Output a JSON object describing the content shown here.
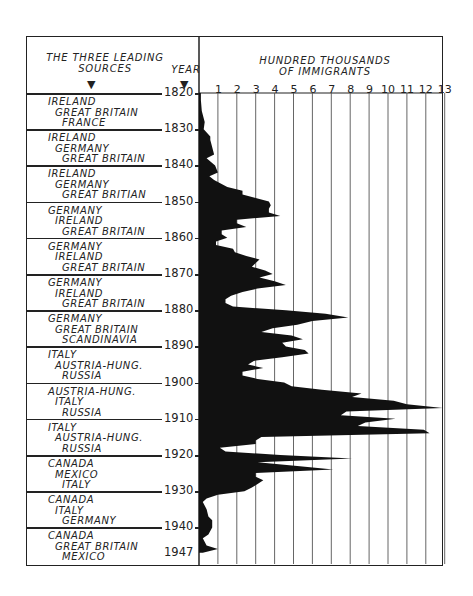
{
  "chart_data": {
    "type": "area",
    "title": "",
    "header_left": "THE THREE LEADING SOURCES",
    "header_year": "YEAR",
    "xlabel": "HUNDRED THOUSANDS OF IMMIGRANTS",
    "ylabel": "YEAR",
    "x_ticks": [
      "1",
      "2",
      "3",
      "4",
      "5",
      "6",
      "7",
      "8",
      "9",
      "10",
      "11",
      "12",
      "13"
    ],
    "xlim": [
      0,
      13
    ],
    "y_ticks": [
      "1820",
      "1830",
      "1840",
      "1850",
      "1860",
      "1870",
      "1880",
      "1890",
      "1900",
      "1910",
      "1920",
      "1930",
      "1940",
      "1947"
    ],
    "ylim": [
      1820,
      1947
    ],
    "grid": "vertical",
    "orientation": "horizontal (years run downward, values extend right)",
    "decades": [
      {
        "period": "1820",
        "sources": [
          "IRELAND",
          "GREAT BRITAIN",
          "FRANCE"
        ]
      },
      {
        "period": "1830",
        "sources": [
          "IRELAND",
          "GERMANY",
          "GREAT BRITAIN"
        ]
      },
      {
        "period": "1840",
        "sources": [
          "IRELAND",
          "GERMANY",
          "GREAT BRITIAN"
        ]
      },
      {
        "period": "1850",
        "sources": [
          "GERMANY",
          "IRELAND",
          "GREAT BRITAIN"
        ]
      },
      {
        "period": "1860",
        "sources": [
          "GERMANY",
          "IRELAND",
          "GREAT BRITAIN"
        ]
      },
      {
        "period": "1870",
        "sources": [
          "GERMANY",
          "IRELAND",
          "GREAT BRITAIN"
        ]
      },
      {
        "period": "1880",
        "sources": [
          "GERMANY",
          "GREAT BRITAIN",
          "SCANDINAVIA"
        ]
      },
      {
        "period": "1890",
        "sources": [
          "ITALY",
          "AUSTRIA-HUNG.",
          "RUSSIA"
        ]
      },
      {
        "period": "1900",
        "sources": [
          "AUSTRIA-HUNG.",
          "ITALY",
          "RUSSIA"
        ]
      },
      {
        "period": "1910",
        "sources": [
          "ITALY",
          "AUSTRIA-HUNG.",
          "RUSSIA"
        ]
      },
      {
        "period": "1920",
        "sources": [
          "CANADA",
          "MEXICO",
          "ITALY"
        ]
      },
      {
        "period": "1930",
        "sources": [
          "CANADA",
          "ITALY",
          "GERMANY"
        ]
      },
      {
        "period": "1940",
        "sources": [
          "CANADA",
          "GREAT BRITAIN",
          "MEXICO"
        ]
      }
    ],
    "series": [
      {
        "name": "Immigrants (hundred thousands)",
        "x": [
          1820,
          1822,
          1825,
          1828,
          1830,
          1832,
          1833,
          1834,
          1836,
          1837,
          1838,
          1840,
          1842,
          1843,
          1844,
          1846,
          1847,
          1848,
          1849,
          1850,
          1851,
          1852,
          1853,
          1854,
          1855,
          1856,
          1857,
          1858,
          1859,
          1860,
          1861,
          1862,
          1863,
          1864,
          1865,
          1866,
          1867,
          1868,
          1869,
          1870,
          1871,
          1872,
          1873,
          1874,
          1875,
          1876,
          1877,
          1878,
          1879,
          1880,
          1881,
          1882,
          1883,
          1884,
          1885,
          1886,
          1887,
          1888,
          1889,
          1890,
          1891,
          1892,
          1893,
          1894,
          1895,
          1896,
          1897,
          1898,
          1899,
          1900,
          1901,
          1902,
          1903,
          1904,
          1905,
          1906,
          1907,
          1908,
          1909,
          1910,
          1911,
          1912,
          1913,
          1914,
          1915,
          1916,
          1917,
          1918,
          1919,
          1920,
          1921,
          1922,
          1923,
          1924,
          1925,
          1926,
          1927,
          1928,
          1929,
          1930,
          1931,
          1932,
          1933,
          1935,
          1937,
          1938,
          1940,
          1942,
          1943,
          1945,
          1946,
          1947
        ],
        "values": [
          0.1,
          0.1,
          0.15,
          0.3,
          0.25,
          0.6,
          0.6,
          0.65,
          0.75,
          0.8,
          0.4,
          0.85,
          1.0,
          0.55,
          0.8,
          1.5,
          2.3,
          2.3,
          3.0,
          3.7,
          3.8,
          3.7,
          3.7,
          4.3,
          2.0,
          2.0,
          2.5,
          1.2,
          1.2,
          1.5,
          0.9,
          0.9,
          1.8,
          1.9,
          2.5,
          3.2,
          3.0,
          2.8,
          3.5,
          3.9,
          3.2,
          4.0,
          4.6,
          3.1,
          2.3,
          1.7,
          1.4,
          1.4,
          1.8,
          4.6,
          6.7,
          7.9,
          6.0,
          5.2,
          3.9,
          3.3,
          4.9,
          5.5,
          4.4,
          4.6,
          5.6,
          5.8,
          4.4,
          2.9,
          2.6,
          3.4,
          2.3,
          2.3,
          3.1,
          4.5,
          4.9,
          6.5,
          8.6,
          8.1,
          10.3,
          11.0,
          12.9,
          7.8,
          7.5,
          10.4,
          8.8,
          8.4,
          11.9,
          12.2,
          3.3,
          3.0,
          3.0,
          1.1,
          1.4,
          4.3,
          8.1,
          3.1,
          5.2,
          7.1,
          3.0,
          3.0,
          3.4,
          3.1,
          2.8,
          2.4,
          1.0,
          0.4,
          0.2,
          0.4,
          0.5,
          0.7,
          0.7,
          0.5,
          0.2,
          0.4,
          1.0,
          0.2
        ]
      }
    ]
  }
}
